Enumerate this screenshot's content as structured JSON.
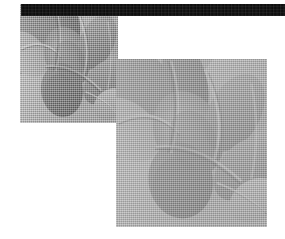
{
  "canvas": {
    "width": 285,
    "height": 239,
    "background_color": "#ffffff",
    "description": "Two overlapping rectangular grayscale halftone image plates beneath a solid black horizontal rule"
  },
  "rule_bar": {
    "name": "top-black-rule",
    "color": "#0b0b0b",
    "x": 21,
    "y": 4,
    "width": 264,
    "height": 12
  },
  "plates": [
    {
      "id": "left",
      "label": "dark-exposure-plate",
      "x": 20,
      "y": 4,
      "width": 98,
      "height": 119,
      "tone": "dark",
      "highlight_color": "#b4b4b4",
      "midtone_color": "#9a9a9a",
      "shadow_color": "#6e6e6e",
      "deep_shadow_color": "#575757",
      "screen": "halftone-dither"
    },
    {
      "id": "right",
      "label": "light-exposure-plate",
      "x": 116,
      "y": 59,
      "width": 151,
      "height": 168,
      "tone": "light",
      "highlight_color": "#ececec",
      "midtone_color": "#d8d8d8",
      "shadow_color": "#c2c2c2",
      "deep_shadow_color": "#b0b0b0",
      "screen": "halftone-dither"
    }
  ],
  "artwork": {
    "subject": "abstract organic curved overlapping lobed forms",
    "shapes": [
      {
        "name": "upper-left-lobe",
        "cx": 18,
        "cy": 22,
        "rx": 20,
        "ry": 34,
        "rot": -28,
        "shade": "mid"
      },
      {
        "name": "upper-center-lobe",
        "cx": 44,
        "cy": 16,
        "rx": 14,
        "ry": 30,
        "rot": -14,
        "shade": "dark"
      },
      {
        "name": "left-flank",
        "cx": 8,
        "cy": 48,
        "rx": 18,
        "ry": 26,
        "rot": -40,
        "shade": "light"
      },
      {
        "name": "center-body",
        "cx": 46,
        "cy": 52,
        "rx": 22,
        "ry": 30,
        "rot": -18,
        "shade": "dark"
      },
      {
        "name": "right-upper-lobe",
        "cx": 76,
        "cy": 38,
        "rx": 17,
        "ry": 28,
        "rot": 22,
        "shade": "mid"
      },
      {
        "name": "lower-center-lobe",
        "cx": 42,
        "cy": 84,
        "rx": 20,
        "ry": 26,
        "rot": -8,
        "shade": "dark"
      },
      {
        "name": "right-lower-band",
        "cx": 82,
        "cy": 76,
        "rx": 16,
        "ry": 24,
        "rot": 34,
        "shade": "mid"
      },
      {
        "name": "bottom-right-wedge",
        "cx": 88,
        "cy": 96,
        "rx": 14,
        "ry": 18,
        "rot": 48,
        "shade": "light"
      }
    ],
    "seam_lines": [
      "upper-left to center diagonal crease",
      "center vertical spine crease",
      "lower-right diagonal crease",
      "far-right vertical crease"
    ]
  }
}
